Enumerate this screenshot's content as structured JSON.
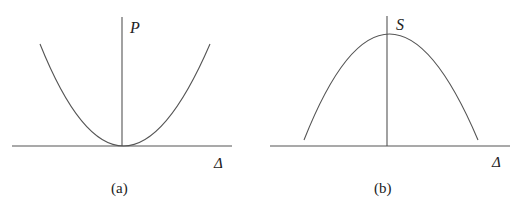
{
  "panels": [
    {
      "id": "a",
      "y_label": "P",
      "x_label": "Δ",
      "caption": "(a)",
      "curve": "upward parabola with minimum at origin"
    },
    {
      "id": "b",
      "y_label": "S",
      "x_label": "Δ",
      "caption": "(b)",
      "curve": "downward parabola with maximum on the vertical axis"
    }
  ]
}
